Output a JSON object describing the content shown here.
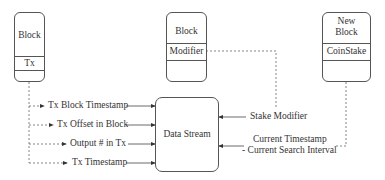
{
  "diagram": {
    "blocks": [
      {
        "id": "block",
        "title": "Block",
        "field": "Tx"
      },
      {
        "id": "modifier-block",
        "title": "Block",
        "field": "Modifier"
      },
      {
        "id": "new-block",
        "title_line1": "New",
        "title_line2": "Block",
        "field": "CoinStake"
      }
    ],
    "center": {
      "label": "Data Stream"
    },
    "inputs_left": [
      {
        "label": "Tx Block Timestamp"
      },
      {
        "label": "Tx Offset in Block"
      },
      {
        "label": "Output # in Tx"
      },
      {
        "label": "Tx Timestamp"
      }
    ],
    "inputs_right": [
      {
        "label": "Stake Modifier"
      },
      {
        "label_line1": "Current Timestamp",
        "label_line2": "- Current Search Interval"
      }
    ],
    "colors": {
      "stroke": "#555555",
      "text": "#333333",
      "background": "#ffffff"
    }
  }
}
